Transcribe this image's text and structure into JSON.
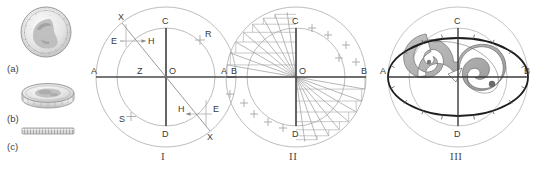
{
  "figure": {
    "background": "#ffffff",
    "ink": "#3a3a3a",
    "faint": "#b9b9b9",
    "mid": "#8f8f8f",
    "shade": "#a8a8a8",
    "bold": "#1d1d1d"
  },
  "coins": {
    "items": [
      {
        "label": "(a)",
        "view": "coin-obverse-face-on"
      },
      {
        "label": "(b)",
        "view": "coin-oblique-tilted"
      },
      {
        "label": "(c)",
        "view": "coin-edge-on-reeded"
      }
    ]
  },
  "diagrams": [
    {
      "numeral": "I",
      "name": "construction-diagram",
      "axis_labels": {
        "left": "A",
        "right": "B",
        "top": "C",
        "bottom": "D",
        "center": "O"
      },
      "points": [
        {
          "label": "X",
          "position": "upper-left"
        },
        {
          "label": "X",
          "position": "lower-right"
        },
        {
          "label": "E",
          "position": "upper-left"
        },
        {
          "label": "H",
          "position": "upper-left-inner"
        },
        {
          "label": "R",
          "position": "upper-right"
        },
        {
          "label": "Z",
          "position": "left-of-center"
        },
        {
          "label": "S",
          "position": "lower-left"
        },
        {
          "label": "H",
          "position": "lower-right-inner"
        },
        {
          "label": "E",
          "position": "lower-right"
        }
      ]
    },
    {
      "numeral": "II",
      "name": "radial-fan-diagram",
      "axis_labels": {
        "left": "A",
        "right": "B",
        "top": "C",
        "bottom": "D",
        "center": "O"
      },
      "points": []
    },
    {
      "numeral": "III",
      "name": "ellipse-projection-diagram",
      "axis_labels": {
        "left": "A",
        "right": "B",
        "top": "C",
        "bottom": "D",
        "center": ""
      },
      "points": []
    }
  ]
}
